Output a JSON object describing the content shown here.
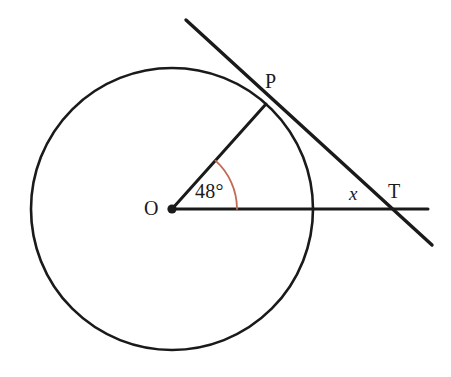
{
  "diagram": {
    "type": "euclidean-geometry-figure",
    "colors": {
      "stroke": "#1a1a1a",
      "angle_arc": "#c06b55",
      "background": "#ffffff"
    },
    "circle": {
      "name": "main-circle",
      "center_label": "O",
      "center_x": 172,
      "center_y": 209,
      "radius": 141
    },
    "points": {
      "center": {
        "label": "O",
        "x": 172,
        "y": 209
      },
      "tangent_point": {
        "label": "P",
        "x": 266,
        "y": 104
      },
      "external_point": {
        "label": "T",
        "x": 388,
        "y": 209
      }
    },
    "segments": [
      {
        "name": "radius-OP",
        "from": "O",
        "to": "P"
      },
      {
        "name": "ray-OT",
        "from": "O",
        "to": "T"
      },
      {
        "name": "tangent-line-at-P",
        "from": "P",
        "to": "T"
      }
    ],
    "angles": {
      "central_angle": {
        "label": "48°",
        "value": 48,
        "unit": "degrees",
        "vertex": "O",
        "arc_radius": 65,
        "color": "#c06b55"
      },
      "unknown_angle": {
        "label": "x",
        "vertex": "T",
        "description": "angle at external point T"
      }
    },
    "lines": {
      "tangent": {
        "start_x": 186,
        "start_y": 20,
        "end_x": 432,
        "end_y": 245
      },
      "horizontal": {
        "start_x": 172,
        "start_y": 209,
        "end_x": 428,
        "end_y": 209
      }
    }
  }
}
